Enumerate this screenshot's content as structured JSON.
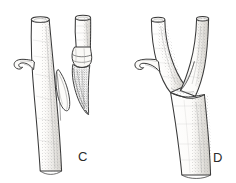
{
  "figure": {
    "background_color": "#ffffff",
    "ink_color": "#3a3a3a",
    "shade_color": "#8c8c8c",
    "fill_color": "#fbfaf8",
    "width": 236,
    "height": 183
  },
  "panels": [
    {
      "id": "c",
      "label": "C",
      "label_x": 78,
      "label_y": 150,
      "caption": "Side-veneer graft with scion wedge inserted beside rootstock",
      "parts": [
        {
          "name": "rootstock-stem",
          "label": "rootstock stem"
        },
        {
          "name": "lateral-branch-stub",
          "label": "lateral branch stub"
        },
        {
          "name": "scion-stem",
          "label": "scion stem"
        },
        {
          "name": "scion-wedge",
          "label": "cut scion wedge"
        },
        {
          "name": "bark-flap",
          "label": "lifted bark flap"
        },
        {
          "name": "graft-cut",
          "label": "graft cut surface"
        }
      ]
    },
    {
      "id": "d",
      "label": "D",
      "label_x": 213,
      "label_y": 151,
      "caption": "Healed graft union forming a Y-shaped fork",
      "parts": [
        {
          "name": "rootstock-stem",
          "label": "rootstock stem"
        },
        {
          "name": "lateral-branch-stub",
          "label": "lateral branch stub"
        },
        {
          "name": "scion-limb",
          "label": "grown scion limb"
        },
        {
          "name": "union-line",
          "label": "healed union line"
        }
      ]
    }
  ]
}
